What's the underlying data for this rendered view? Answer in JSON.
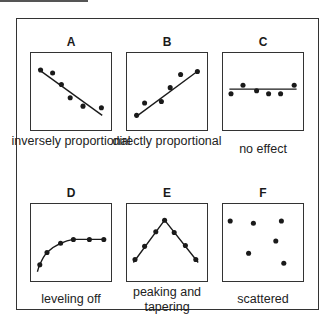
{
  "panels": [
    {
      "letter": "A",
      "caption": "inversely proportional",
      "kind": "line",
      "points": [
        [
          0.12,
          0.78
        ],
        [
          0.27,
          0.74
        ],
        [
          0.38,
          0.59
        ],
        [
          0.49,
          0.42
        ],
        [
          0.65,
          0.31
        ],
        [
          0.88,
          0.29
        ]
      ],
      "trend": [
        [
          0.09,
          0.79
        ],
        [
          0.89,
          0.19
        ]
      ]
    },
    {
      "letter": "B",
      "caption": "directly proportional",
      "kind": "line",
      "points": [
        [
          0.12,
          0.19
        ],
        [
          0.22,
          0.35
        ],
        [
          0.43,
          0.37
        ],
        [
          0.54,
          0.55
        ],
        [
          0.67,
          0.72
        ],
        [
          0.88,
          0.76
        ]
      ],
      "trend": [
        [
          0.11,
          0.17
        ],
        [
          0.89,
          0.77
        ]
      ]
    },
    {
      "letter": "C",
      "caption": "no effect",
      "kind": "line",
      "points": [
        [
          0.1,
          0.47
        ],
        [
          0.25,
          0.58
        ],
        [
          0.42,
          0.51
        ],
        [
          0.57,
          0.47
        ],
        [
          0.72,
          0.47
        ],
        [
          0.89,
          0.58
        ]
      ],
      "trend": [
        [
          0.08,
          0.53
        ],
        [
          0.92,
          0.53
        ]
      ]
    },
    {
      "letter": "D",
      "caption": "leveling off",
      "kind": "curve",
      "points": [
        [
          0.11,
          0.21
        ],
        [
          0.2,
          0.37
        ],
        [
          0.37,
          0.49
        ],
        [
          0.53,
          0.54
        ],
        [
          0.73,
          0.54
        ],
        [
          0.91,
          0.54
        ]
      ],
      "trend": [
        [
          0.08,
          0.12
        ],
        [
          0.11,
          0.21
        ],
        [
          0.2,
          0.37
        ],
        [
          0.37,
          0.49
        ],
        [
          0.53,
          0.54
        ],
        [
          0.73,
          0.54
        ],
        [
          0.93,
          0.54
        ]
      ]
    },
    {
      "letter": "E",
      "caption": "peaking and tapering",
      "kind": "polyline",
      "points": [
        [
          0.1,
          0.28
        ],
        [
          0.22,
          0.45
        ],
        [
          0.36,
          0.64
        ],
        [
          0.47,
          0.79
        ],
        [
          0.59,
          0.63
        ],
        [
          0.73,
          0.46
        ],
        [
          0.86,
          0.28
        ]
      ],
      "trend": [
        [
          0.08,
          0.24
        ],
        [
          0.47,
          0.79
        ],
        [
          0.89,
          0.24
        ]
      ]
    },
    {
      "letter": "F",
      "caption": "scattered",
      "kind": "none",
      "points": [
        [
          0.09,
          0.78
        ],
        [
          0.38,
          0.75
        ],
        [
          0.73,
          0.78
        ],
        [
          0.66,
          0.52
        ],
        [
          0.32,
          0.36
        ],
        [
          0.76,
          0.23
        ]
      ],
      "trend": []
    }
  ],
  "colors": {
    "ink": "#1a1a1a",
    "frame": "#333333"
  }
}
